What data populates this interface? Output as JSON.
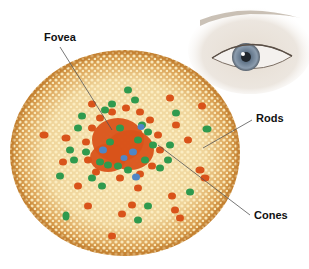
{
  "diagram": {
    "labels": {
      "fovea": "Fovea",
      "rods": "Rods",
      "cones": "Cones"
    },
    "colors": {
      "background": "#ffffff",
      "disc_base": "#f2d9a0",
      "disc_rim": "#c98a3a",
      "rod_dot": "#fbeab8",
      "cone_red": "#d9531a",
      "cone_green": "#2f9a4e",
      "cone_blue": "#4f86c6",
      "leader_line": "#555555",
      "iris": "#7d8fa3"
    },
    "disc": {
      "cx": 125,
      "cy": 153,
      "rx": 115,
      "ry": 103
    },
    "leaders": {
      "fovea": {
        "x1": 60,
        "y1": 47,
        "x2": 112,
        "y2": 130
      },
      "rods": {
        "x1": 252,
        "y1": 120,
        "x2": 203,
        "y2": 148
      },
      "cones": {
        "x1": 250,
        "y1": 215,
        "x2": 158,
        "y2": 145
      }
    }
  }
}
